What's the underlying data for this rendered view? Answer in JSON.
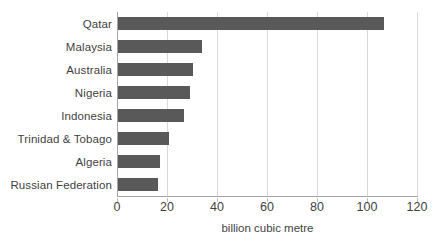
{
  "chart_data": {
    "type": "bar",
    "orientation": "horizontal",
    "title": "",
    "xlabel": "billion cubic metre",
    "ylabel": "",
    "xlim": [
      0,
      120
    ],
    "xticks": [
      0,
      20,
      40,
      60,
      80,
      100,
      120
    ],
    "xtick_labels": [
      "0",
      "20",
      "40",
      "60",
      "80",
      "100",
      "120"
    ],
    "grid": "vertical",
    "legend": "none",
    "bar_color": "#595959",
    "gridline_color": "#D9D9D9",
    "axis_color": "#A6A6A6",
    "categories": [
      "Qatar",
      "Malaysia",
      "Australia",
      "Nigeria",
      "Indonesia",
      "Trinidad & Tobago",
      "Algeria",
      "Russian Federation"
    ],
    "values": [
      106.4,
      33.6,
      30.0,
      28.8,
      26.4,
      20.4,
      16.8,
      16.0
    ],
    "series": [
      {
        "name": "LNG exports",
        "values": [
          106.4,
          33.6,
          30.0,
          28.8,
          26.4,
          20.4,
          16.8,
          16.0
        ]
      }
    ]
  }
}
